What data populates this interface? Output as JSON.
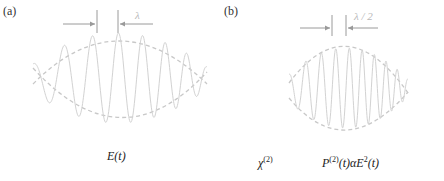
{
  "panel_a": {
    "label": "(a)",
    "wavelength_label": "λ",
    "caption_main": "E(t)",
    "wave": {
      "cycles": 7,
      "chirp": "decreasing wavelength toward right"
    }
  },
  "panel_b": {
    "label": "(b)",
    "wavelength_label": "λ / 2",
    "chi_label": "χ",
    "chi_sup": "(2)",
    "caption_p": "P",
    "caption_p_sup": "(2)",
    "caption_rest": "(t)αE",
    "caption_e_sup": "2",
    "caption_tail": "(t)",
    "wave": {
      "cycles": 9,
      "chirp": "decreasing wavelength toward right"
    }
  },
  "colors": {
    "wave": "#cfcfcf",
    "envelope": "#c8c8c8",
    "arrow": "#9a9a9a",
    "text": "#222222"
  }
}
